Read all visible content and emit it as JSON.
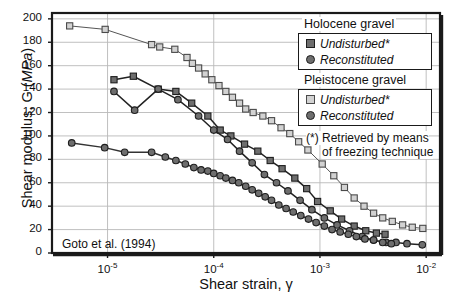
{
  "chart_data": {
    "type": "line",
    "title": "",
    "xlabel": "Shear strain, γ",
    "ylabel_main": "Shear modulus, G (",
    "ylabel_unit": "MPa",
    "ylabel_tail": ")",
    "annotation": "Goto et al. (1994)",
    "xscale": "log",
    "xlim": [
      3e-06,
      0.0135
    ],
    "ylim": [
      0,
      205
    ],
    "grid": true,
    "xticks": [
      1e-05,
      0.0001,
      0.001,
      0.01
    ],
    "xtick_labels": [
      "10-5",
      "10-4",
      "10-3",
      "10-2"
    ],
    "xtick_bases": [
      "10",
      "10",
      "10",
      "10"
    ],
    "xtick_exps": [
      "-5",
      "-4",
      "-3",
      "-2"
    ],
    "yticks": [
      0,
      20,
      40,
      60,
      80,
      100,
      120,
      140,
      160,
      180,
      200
    ],
    "ytick_labels": [
      "0",
      "20",
      "40",
      "60",
      "80",
      "100",
      "120",
      "140",
      "160",
      "180",
      "200"
    ],
    "legend_position": "top-right",
    "series": [
      {
        "name": "Pleistocene gravel - Undisturbed*",
        "marker": "square-open",
        "color": "#cfcfcf",
        "edge": "#3a3a3a",
        "line": "#555555",
        "points": [
          [
            4.4e-06,
            194
          ],
          [
            9.5e-06,
            191
          ],
          [
            2.6e-05,
            178
          ],
          [
            3.1e-05,
            176
          ],
          [
            4.3e-05,
            174
          ],
          [
            5.6e-05,
            167
          ],
          [
            6.3e-05,
            162
          ],
          [
            7.2e-05,
            158
          ],
          [
            8.3e-05,
            153
          ],
          [
            9.6e-05,
            148
          ],
          [
            0.000112,
            143
          ],
          [
            0.00013,
            138
          ],
          [
            0.00015,
            133
          ],
          [
            0.000175,
            128
          ],
          [
            0.0002,
            123
          ],
          [
            0.000235,
            120
          ],
          [
            0.00029,
            117
          ],
          [
            0.00035,
            113
          ],
          [
            0.00043,
            107
          ],
          [
            0.00052,
            102
          ],
          [
            0.00063,
            95
          ],
          [
            0.00077,
            88
          ],
          [
            0.00105,
            76
          ],
          [
            0.00135,
            66
          ],
          [
            0.0017,
            56
          ],
          [
            0.0021,
            47
          ],
          [
            0.0026,
            40
          ],
          [
            0.0032,
            34
          ],
          [
            0.0039,
            30
          ],
          [
            0.0048,
            27
          ],
          [
            0.006,
            24
          ],
          [
            0.0074,
            22
          ],
          [
            0.0093,
            21
          ]
        ]
      },
      {
        "name": "Holocene gravel - Undisturbed*",
        "marker": "square-filled",
        "color": "#6e6e6e",
        "edge": "#222222",
        "line": "#222222",
        "points": [
          [
            1.15e-05,
            148
          ],
          [
            1.75e-05,
            151
          ],
          [
            3e-05,
            140
          ],
          [
            4.4e-05,
            138
          ],
          [
            6.2e-05,
            128
          ],
          [
            8.8e-05,
            117
          ],
          [
            0.000115,
            105
          ],
          [
            0.000145,
            100
          ],
          [
            0.000195,
            93
          ],
          [
            0.00026,
            87
          ],
          [
            0.00034,
            79
          ],
          [
            0.00044,
            72
          ],
          [
            0.00058,
            64
          ],
          [
            0.00075,
            55
          ],
          [
            0.00095,
            44
          ],
          [
            0.00125,
            36
          ],
          [
            0.0016,
            29
          ],
          [
            0.0021,
            23
          ],
          [
            0.0027,
            19
          ],
          [
            0.0034,
            17
          ],
          [
            0.0041,
            16
          ]
        ]
      },
      {
        "name": "Holocene gravel - Reconstituted",
        "marker": "circle-filled",
        "color": "#6e6e6e",
        "edge": "#222222",
        "line": "#222222",
        "points": [
          [
            1.15e-05,
            138
          ],
          [
            1.8e-05,
            122
          ],
          [
            3e-05,
            140
          ],
          [
            4.6e-05,
            131
          ],
          [
            7.2e-05,
            117
          ],
          [
            0.0001,
            105
          ],
          [
            0.000135,
            97
          ],
          [
            0.000175,
            87
          ],
          [
            0.00023,
            77
          ],
          [
            0.0003,
            67
          ],
          [
            0.00039,
            60
          ],
          [
            0.0005,
            53
          ],
          [
            0.00065,
            45
          ],
          [
            0.00084,
            37
          ],
          [
            0.0011,
            30
          ],
          [
            0.00145,
            24
          ],
          [
            0.0019,
            19
          ],
          [
            0.0025,
            14
          ],
          [
            0.0032,
            11
          ],
          [
            0.0042,
            9
          ],
          [
            0.0052,
            9
          ],
          [
            0.0066,
            8
          ],
          [
            0.0092,
            7
          ]
        ]
      },
      {
        "name": "Pleistocene gravel - Reconstituted",
        "marker": "circle-filled",
        "color": "#6e6e6e",
        "edge": "#222222",
        "line": "#333333",
        "points": [
          [
            4.6e-06,
            94
          ],
          [
            9.4e-06,
            90
          ],
          [
            1.45e-05,
            86
          ],
          [
            2.6e-05,
            86
          ],
          [
            3.5e-05,
            82
          ],
          [
            4.4e-05,
            79
          ],
          [
            5.4e-05,
            76
          ],
          [
            6.5e-05,
            73
          ],
          [
            7.6e-05,
            71
          ],
          [
            8.8e-05,
            70
          ],
          [
            0.0001,
            68
          ],
          [
            0.000115,
            66
          ],
          [
            0.00013,
            64
          ],
          [
            0.00015,
            62
          ],
          [
            0.000172,
            60
          ],
          [
            0.0002,
            57
          ],
          [
            0.00023,
            54
          ],
          [
            0.000265,
            51
          ],
          [
            0.000305,
            48
          ],
          [
            0.00035,
            45
          ],
          [
            0.00041,
            41
          ],
          [
            0.00048,
            38
          ],
          [
            0.00056,
            35
          ],
          [
            0.00066,
            32
          ],
          [
            0.00078,
            29
          ],
          [
            0.00092,
            26
          ],
          [
            0.0011,
            23
          ],
          [
            0.0013,
            20
          ],
          [
            0.00155,
            18
          ],
          [
            0.00185,
            16
          ],
          [
            0.0022,
            14
          ],
          [
            0.00265,
            12
          ],
          [
            0.0032,
            11
          ],
          [
            0.0039,
            9
          ],
          [
            0.0047,
            8
          ]
        ]
      }
    ]
  },
  "legend": {
    "group1": {
      "heading": "Holocene gravel",
      "rows": [
        {
          "label": "Undisturbed*",
          "marker": "square-filled"
        },
        {
          "label": "Reconstituted",
          "marker": "circle-filled"
        }
      ]
    },
    "group2": {
      "heading": "Pleistocene gravel",
      "rows": [
        {
          "label": "Undisturbed*",
          "marker": "square-open"
        },
        {
          "label": "Reconstituted",
          "marker": "circle-filled"
        }
      ]
    },
    "note_line1": "(*) Retrieved by means",
    "note_line2": "of freezing technique"
  },
  "colors": {
    "frame": "#1a1a1a",
    "grid": "#b9b9b9",
    "dark_marker": "#6e6e6e",
    "light_marker": "#d2d2d2",
    "text": "#111111"
  }
}
